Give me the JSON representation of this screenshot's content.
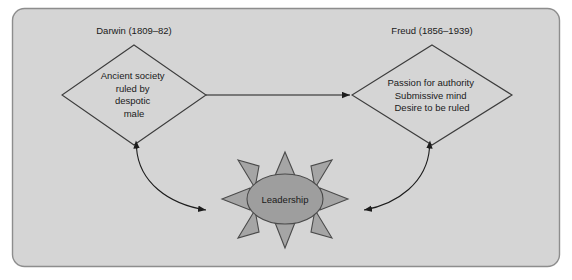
{
  "diagram": {
    "title_left": "Darwin (1809–82)",
    "title_right": "Freud (1856–1939)",
    "nodes": {
      "left_diamond": {
        "name": "ancient-society-diamond",
        "lines": [
          "Ancient society",
          "ruled by",
          "despotic",
          "male"
        ]
      },
      "right_diamond": {
        "name": "passion-authority-diamond",
        "lines": [
          "Passion for authority",
          "Submissive mind",
          "Desire to be ruled"
        ]
      },
      "center_burst": {
        "name": "leadership-burst",
        "label": "Leadership",
        "ray_count": 8
      }
    },
    "connectors": [
      {
        "name": "darwin-to-freud-arrow",
        "from": "left_diamond",
        "to": "right_diamond",
        "style": "straight",
        "arrowheads": "end"
      },
      {
        "name": "darwin-to-leadership-arrow",
        "from": "left_diamond",
        "to": "center_burst",
        "style": "curved",
        "arrowheads": "both"
      },
      {
        "name": "freud-to-leadership-arrow",
        "from": "right_diamond",
        "to": "center_burst",
        "style": "curved",
        "arrowheads": "both"
      }
    ],
    "colors": {
      "frame_fill": "#d5d5d5",
      "frame_border": "#8d8d8d",
      "shape_outline": "#3c3c3c",
      "burst_core_fill": "#9e9e9e",
      "burst_ray_fill": "#a5a5a5",
      "connector": "#1c1c1c",
      "text": "#1a1a1a",
      "page_background": "#ffffff"
    }
  }
}
